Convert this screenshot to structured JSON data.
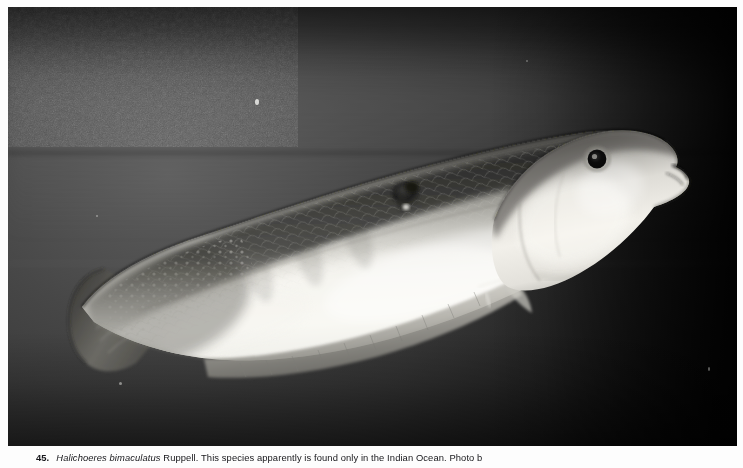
{
  "page": {
    "background_color": "#fdfdfd",
    "width": 743,
    "height": 468
  },
  "plate": {
    "kind": "black-and-white-photograph",
    "subject": "wrasse-fish-lateral-view",
    "background_color": "#3a3a3a",
    "dark_corner_color": "#050505",
    "body_highlight_color": "#f2f1ed",
    "body_shadow_color": "#4a4a48",
    "fin_color": "#b9b8b2",
    "eye_color": "#0c0c0c",
    "spot_color": "#1f1f1f",
    "alt_text": "Lateral view of a wrasse with two dark body spots, pale belly and darker speckled back, photographed against a dark aquarium background."
  },
  "caption": {
    "figure_number": "45.",
    "species_genus": "Halichoeres bimaculatus",
    "authority": "Ruppell.",
    "text": "This species apparently is found only in the Indian Ocean. Photo b",
    "full_text": "45.  Halichoeres bimaculatus Ruppell. This species apparently is found only in the Indian Ocean. Photo b"
  }
}
